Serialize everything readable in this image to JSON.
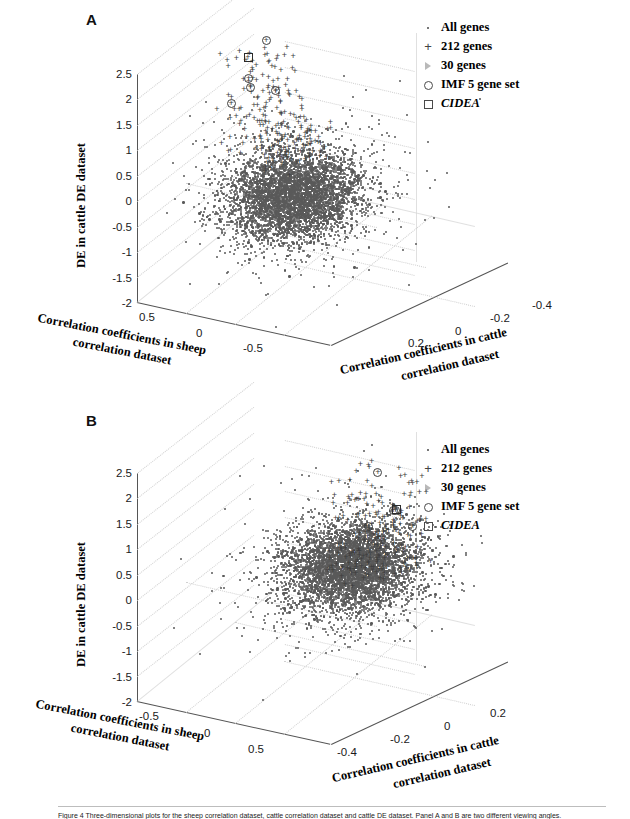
{
  "figure": {
    "caption_prefix": "Figure 4",
    "caption": "Figure 4 Three-dimensional plots for the sheep correlation dataset, cattle correlation dataset and cattle DE dataset. Panel A and B are two different viewing angles."
  },
  "legend": {
    "items": [
      {
        "marker": "dot-marker",
        "label": "All genes",
        "italic": false
      },
      {
        "marker": "plus-marker",
        "label": "212 genes",
        "italic": false
      },
      {
        "marker": "triangle-marker",
        "label": "30 genes",
        "italic": false
      },
      {
        "marker": "circle-marker",
        "label": "IMF 5 gene set",
        "italic": false
      },
      {
        "marker": "square-marker",
        "label": "CIDEA",
        "italic": true
      }
    ]
  },
  "panels": [
    {
      "id": "A",
      "label": "A",
      "axes": {
        "z": {
          "title": "DE in cattle DE dataset",
          "ticks": [
            "2.5",
            "2",
            "1.5",
            "1",
            "0.5",
            "0",
            "-0.5",
            "-1",
            "-1.5",
            "-2"
          ],
          "min": -2,
          "max": 2.5
        },
        "x": {
          "title_line1": "Correlation coefficients in sheep",
          "title_line2": "correlation dataset",
          "ticks": [
            "0.5",
            "0",
            "-0.5"
          ],
          "min": -0.5,
          "max": 0.5
        },
        "y": {
          "title_line1": "Correlation coefficients in cattle",
          "title_line2": "correlation dataset",
          "ticks": [
            "0.2",
            "0",
            "-0.2",
            "-0.4"
          ],
          "min": -0.4,
          "max": 0.2
        }
      }
    },
    {
      "id": "B",
      "label": "B",
      "axes": {
        "z": {
          "title": "DE in cattle DE dataset",
          "ticks": [
            "2.5",
            "2",
            "1.5",
            "1",
            "0.5",
            "0",
            "-0.5",
            "-1",
            "-1.5",
            "-2"
          ],
          "min": -2,
          "max": 2.5
        },
        "x": {
          "title_line1": "Correlation coefficients in sheep",
          "title_line2": "correlation dataset",
          "ticks": [
            "-0.5",
            "0",
            "0.5"
          ],
          "min": -0.5,
          "max": 0.5
        },
        "y": {
          "title_line1": "Correlation coefficients in cattle",
          "title_line2": "correlation dataset",
          "ticks": [
            "-0.4",
            "-0.2",
            "0",
            "0.2"
          ],
          "min": -0.4,
          "max": 0.2
        }
      }
    }
  ],
  "chart_data": {
    "type": "scatter",
    "xlabel": "Correlation coefficients in sheep correlation dataset",
    "ylabel": "Correlation coefficients in cattle correlation dataset",
    "zlabel": "DE in cattle DE dataset",
    "xlim": [
      -0.5,
      0.5
    ],
    "ylim": [
      -0.4,
      0.2
    ],
    "zlim": [
      -2,
      2.5
    ],
    "grid": true,
    "legend_position": "upper right",
    "series": [
      {
        "name": "All genes",
        "marker": "dot",
        "color": "#5a5a5a",
        "n_points": 4000,
        "description": "dense ellipsoidal cloud centred near x=0, y=0, z=0"
      },
      {
        "name": "212 genes",
        "marker": "plus",
        "color": "#3d3d3d",
        "n_points": 212,
        "description": "scattered at elevated DE values, z roughly 0.5 to 2.5"
      },
      {
        "name": "30 genes",
        "marker": "triangle",
        "color": "#b9b9b9",
        "n_points": 30
      },
      {
        "name": "IMF 5 gene set",
        "marker": "circle",
        "color": "#3d3d3d",
        "n_points": 5,
        "points_panel_a": [
          {
            "x": 0.32,
            "y": -0.12,
            "z": 2.45
          },
          {
            "x": 0.38,
            "y": -0.1,
            "z": 1.7
          },
          {
            "x": 0.34,
            "y": -0.08,
            "z": 1.62
          },
          {
            "x": 0.3,
            "y": -0.14,
            "z": 1.42
          },
          {
            "x": 0.41,
            "y": -0.06,
            "z": 1.3
          }
        ]
      },
      {
        "name": "CIDEA",
        "marker": "square",
        "color": "#2a2a2a",
        "n_points": 1,
        "points_panel_a": [
          {
            "x": 0.46,
            "y": -0.15,
            "z": 1.92
          }
        ]
      }
    ]
  }
}
